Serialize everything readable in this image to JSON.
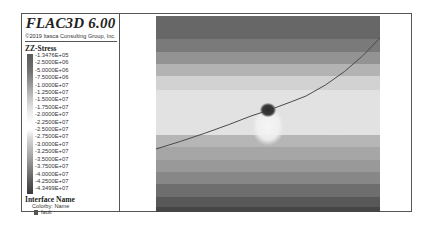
{
  "header": {
    "title": "FLAC3D 6.00",
    "copyright": "©2019 Itasca Consulting Group, Inc."
  },
  "legend": {
    "contour_title": "ZZ-Stress",
    "ticks": [
      "-1.3476E+05",
      "-2.5000E+06",
      "-5.0000E+06",
      "-7.5000E+06",
      "-1.0000E+07",
      "-1.2500E+07",
      "-1.5000E+07",
      "-1.7500E+07",
      "-2.0000E+07",
      "-2.2500E+07",
      "-2.5000E+07",
      "-2.7500E+07",
      "-3.0000E+07",
      "-3.2500E+07",
      "-3.5000E+07",
      "-3.7500E+07",
      "-4.0000E+07",
      "-4.2500E+07",
      "-4.3499E+07"
    ],
    "interface_title": "Interface Name",
    "colorby": "Colorby: Name",
    "interface_items": [
      {
        "label": "fault",
        "color": "#555555"
      }
    ]
  },
  "plot": {
    "variable": "ZZ-Stress",
    "bands": [
      {
        "y": 0,
        "h": 23,
        "color": "#676767"
      },
      {
        "y": 23,
        "h": 13,
        "color": "#7a7a7a"
      },
      {
        "y": 36,
        "h": 12,
        "color": "#939393"
      },
      {
        "y": 48,
        "h": 12,
        "color": "#b3b3b3"
      },
      {
        "y": 60,
        "h": 14,
        "color": "#d2d2d2"
      },
      {
        "y": 74,
        "h": 45,
        "color": "#e2e2e2"
      },
      {
        "y": 119,
        "h": 12,
        "color": "#b6b6b6"
      },
      {
        "y": 131,
        "h": 13,
        "color": "#a6a6a6"
      },
      {
        "y": 144,
        "h": 12,
        "color": "#999999"
      },
      {
        "y": 156,
        "h": 12,
        "color": "#878787"
      },
      {
        "y": 168,
        "h": 13,
        "color": "#6e6e6e"
      },
      {
        "y": 181,
        "h": 10,
        "color": "#585858"
      },
      {
        "y": 191,
        "h": 5,
        "color": "#464646"
      }
    ],
    "fault_color": "#4a4a4a",
    "tunnel_color": "#2f2f2f"
  }
}
